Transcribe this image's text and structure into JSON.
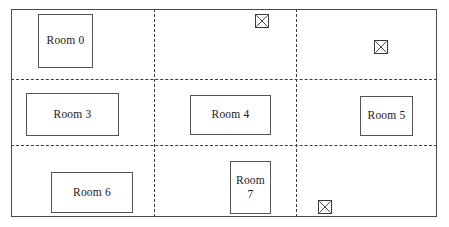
{
  "diagram": {
    "canvas": {
      "width": 449,
      "height": 227,
      "background": "#ffffff"
    },
    "outline": {
      "name": "building-outline",
      "x": 11,
      "y": 9,
      "width": 426,
      "height": 208,
      "stroke": "#4a4a4a",
      "style": "solid"
    },
    "dividers": {
      "stroke": "#3c3c3c",
      "style": "dashed",
      "horizontal": [
        {
          "name": "divider-horizontal-upper",
          "y": 79,
          "x": 11,
          "width": 426
        },
        {
          "name": "divider-horizontal-lower",
          "y": 145,
          "x": 11,
          "width": 426
        }
      ],
      "vertical": [
        {
          "name": "divider-vertical-left",
          "x": 154,
          "y": 9,
          "height": 208
        },
        {
          "name": "divider-vertical-right",
          "x": 296,
          "y": 9,
          "height": 208
        }
      ]
    },
    "rooms": [
      {
        "id": "room-0",
        "label": "Room 0",
        "lines": [
          "Room 0"
        ],
        "x": 38,
        "y": 14,
        "width": 55,
        "height": 54
      },
      {
        "id": "room-3",
        "label": "Room 3",
        "lines": [
          "Room 3"
        ],
        "x": 26,
        "y": 93,
        "width": 93,
        "height": 43
      },
      {
        "id": "room-4",
        "label": "Room 4",
        "lines": [
          "Room 4"
        ],
        "x": 190,
        "y": 95,
        "width": 81,
        "height": 40
      },
      {
        "id": "room-5",
        "label": "Room 5",
        "lines": [
          "Room 5"
        ],
        "x": 360,
        "y": 96,
        "width": 53,
        "height": 40
      },
      {
        "id": "room-6",
        "label": "Room 6",
        "lines": [
          "Room 6"
        ],
        "x": 51,
        "y": 172,
        "width": 82,
        "height": 41
      },
      {
        "id": "room-7",
        "label": "Room 7",
        "lines": [
          "Room",
          "7"
        ],
        "x": 230,
        "y": 161,
        "width": 41,
        "height": 53
      }
    ],
    "markers": [
      {
        "id": "marker-1",
        "name": "crossed-box-marker",
        "x": 255,
        "y": 14,
        "size": 14
      },
      {
        "id": "marker-2",
        "name": "crossed-box-marker",
        "x": 374,
        "y": 40,
        "size": 14
      },
      {
        "id": "marker-3",
        "name": "crossed-box-marker",
        "x": 318,
        "y": 200,
        "size": 14
      }
    ]
  },
  "chart_data": {
    "type": "diagram",
    "room_labels": [
      "Room 0",
      "Room 3",
      "Room 4",
      "Room 5",
      "Room 6",
      "Room 7"
    ],
    "room_count": 6,
    "marker_count": 3,
    "grid_cells": {
      "columns": 3,
      "rows": 3
    }
  }
}
